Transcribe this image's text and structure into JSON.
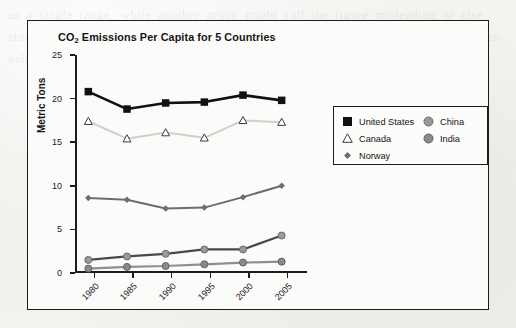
{
  "figure": {
    "title_main": "CO",
    "title_sub": "2",
    "title_rest": " Emissions Per Capita for 5 Countries"
  },
  "ghost_text": "as a single range, while another group might call the figure misleading or else simply wrong, because the data are distributed over a wide interval and the mean value alone cannot convey that spread to the reader of the report.",
  "chart_data": {
    "type": "line",
    "title": "CO2 Emissions Per Capita for 5 Countries",
    "xlabel": "",
    "ylabel": "Metric Tons",
    "categories": [
      "1980",
      "1985",
      "1990",
      "1995",
      "2000",
      "2005"
    ],
    "ylim": [
      0,
      25
    ],
    "yticks": [
      0,
      5,
      10,
      15,
      20,
      25
    ],
    "grid": false,
    "legend_position": "upper right",
    "series": [
      {
        "name": "United States",
        "values": [
          20.8,
          18.8,
          19.5,
          19.6,
          20.4,
          19.8
        ],
        "color": "#111111",
        "marker": "square",
        "marker_fill": "#111111",
        "line_width": 2.6,
        "marker_size": 7.5
      },
      {
        "name": "Canada",
        "values": [
          17.4,
          15.4,
          16.1,
          15.5,
          17.5,
          17.3
        ],
        "color": "#cfcfcb",
        "marker": "triangle",
        "marker_fill": "#ffffff",
        "marker_stroke": "#3a3a3a",
        "line_width": 2.0,
        "marker_size": 7.5
      },
      {
        "name": "Norway",
        "values": [
          8.6,
          8.4,
          7.4,
          7.5,
          8.7,
          10.0
        ],
        "color": "#6d6d6d",
        "marker": "diamond",
        "marker_fill": "#6d6d6d",
        "line_width": 2.0,
        "marker_size": 6.5
      },
      {
        "name": "China",
        "values": [
          1.5,
          1.9,
          2.2,
          2.7,
          2.7,
          4.3
        ],
        "color": "#4a4a4a",
        "marker": "circle",
        "marker_fill": "#9a9a9a",
        "marker_stroke": "#6a6a6a",
        "line_width": 2.2,
        "marker_size": 7.0
      },
      {
        "name": "India",
        "values": [
          0.5,
          0.7,
          0.8,
          1.0,
          1.2,
          1.3
        ],
        "color": "#8f8f8f",
        "marker": "circle",
        "marker_fill": "#8a8a8a",
        "marker_stroke": "#5f5f5f",
        "line_width": 2.2,
        "marker_size": 7.0
      }
    ]
  },
  "legend": {
    "left_column": [
      "United States",
      "Canada",
      "Norway"
    ],
    "right_column": [
      "China",
      "India"
    ]
  }
}
